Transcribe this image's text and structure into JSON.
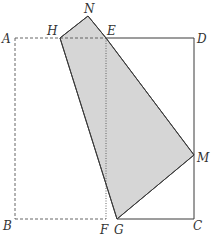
{
  "diagram": {
    "type": "geometry-folding",
    "colors": {
      "stroke": "#3a3a3a",
      "fill": "#d6d6d6",
      "dashed": "#555555"
    },
    "points": {
      "A": {
        "x": 15,
        "y": 38
      },
      "D": {
        "x": 194,
        "y": 38
      },
      "B": {
        "x": 15,
        "y": 219
      },
      "C": {
        "x": 194,
        "y": 219
      },
      "E": {
        "x": 106,
        "y": 38
      },
      "F": {
        "x": 106,
        "y": 219
      },
      "H": {
        "x": 60,
        "y": 38
      },
      "N": {
        "x": 88,
        "y": 16
      },
      "M": {
        "x": 194,
        "y": 155
      },
      "G": {
        "x": 117,
        "y": 219
      }
    },
    "labels": {
      "A": "A",
      "B": "B",
      "C": "C",
      "D": "D",
      "E": "E",
      "F": "F",
      "G": "G",
      "H": "H",
      "M": "M",
      "N": "N"
    },
    "segments": {
      "solid": [
        "E-D",
        "D-C",
        "C-G"
      ],
      "dashed": [
        "A-E",
        "A-B",
        "B-F"
      ],
      "dotted": [
        "E-F"
      ]
    },
    "shaded_polygon": [
      "H",
      "N",
      "E",
      "M",
      "G"
    ]
  }
}
